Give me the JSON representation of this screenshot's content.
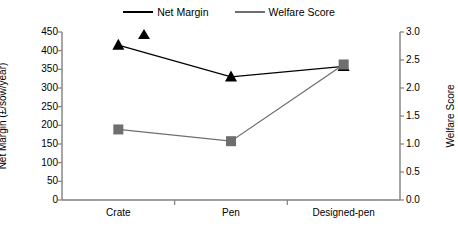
{
  "chart_data": {
    "type": "line",
    "title": "",
    "categories": [
      "Crate",
      "Pen",
      "Designed-pen"
    ],
    "series": [
      {
        "name": "Net Margin",
        "axis": "left",
        "marker": "triangle",
        "color": "#000000",
        "values": [
          415,
          330,
          358
        ]
      },
      {
        "name": "Welfare Score",
        "axis": "right",
        "marker": "square",
        "color": "#6e6e6e",
        "values": [
          1.26,
          1.05,
          2.42
        ]
      }
    ],
    "xlabel": "",
    "ylabel": "Net Margin (£/sow/year)",
    "y2label": "Welfare Score",
    "ylim": [
      0,
      450
    ],
    "y2lim": [
      0,
      3.0
    ],
    "yticks": [
      "0",
      "50",
      "100",
      "150",
      "200",
      "250",
      "300",
      "350",
      "400",
      "450"
    ],
    "y2ticks": [
      "0.0",
      "0.5",
      "1.0",
      "1.5",
      "2.0",
      "2.5",
      "3.0"
    ],
    "grid": false,
    "legend_position": "top-center"
  },
  "legend": {
    "entries": [
      {
        "label": "Net Margin"
      },
      {
        "label": "Welfare Score"
      }
    ]
  }
}
